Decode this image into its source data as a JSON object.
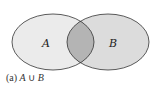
{
  "diagram": {
    "type": "venn",
    "sets": [
      {
        "id": "A",
        "label": "A",
        "fill": "#ebebeb"
      },
      {
        "id": "B",
        "label": "B",
        "fill": "#dcdcdc"
      }
    ],
    "intersection_fill": "#b4b4b4",
    "stroke": "#333333"
  },
  "caption": {
    "prefix": "(a)",
    "left": "A",
    "operator": "∪",
    "right": "B"
  }
}
